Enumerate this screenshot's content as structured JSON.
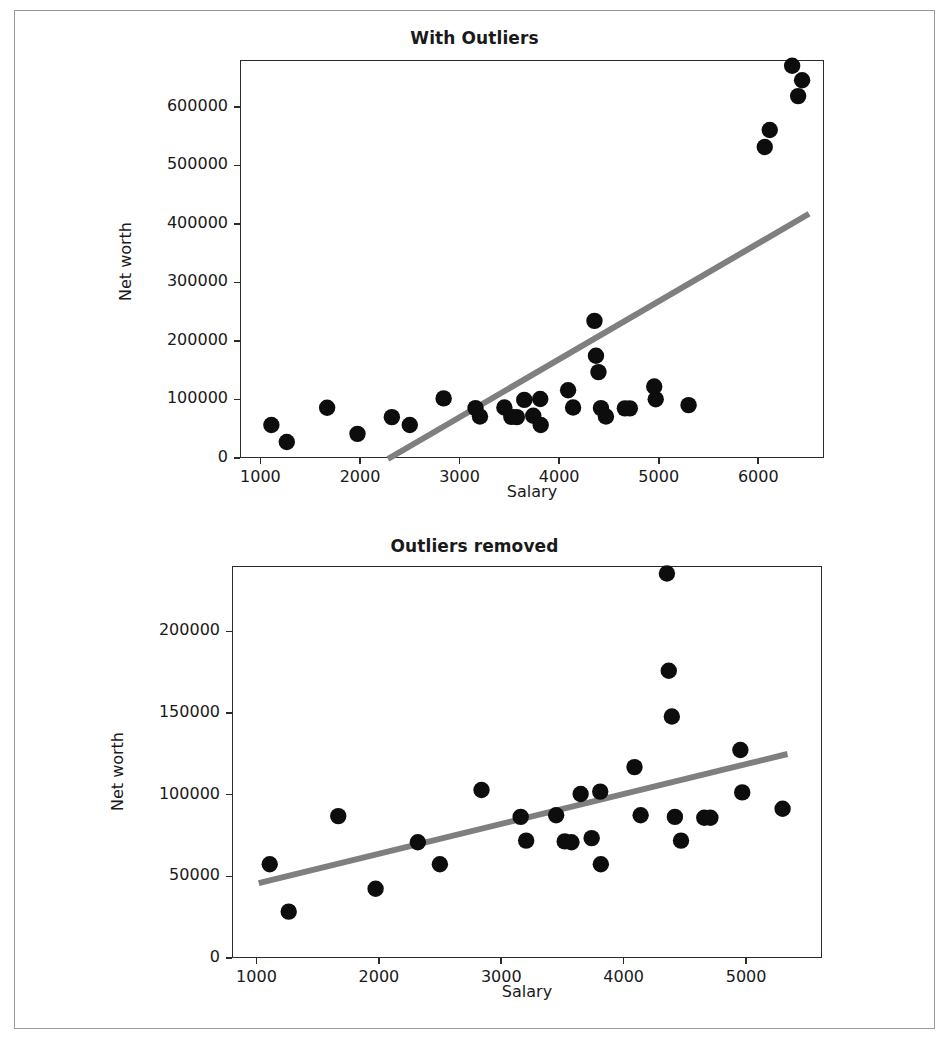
{
  "figure": {
    "background": "#ffffff",
    "border_color": "#9a9a9a",
    "marker_color": "#0d0d0d",
    "line_color": "#7f7f7f"
  },
  "chart_data": [
    {
      "type": "scatter",
      "title": "With Outliers",
      "xlabel": "Salary",
      "ylabel": "Net worth",
      "xlim": [
        795,
        6660
      ],
      "ylim": [
        0,
        680000
      ],
      "xticks": [
        1000,
        2000,
        3000,
        4000,
        5000,
        6000
      ],
      "xticklabels": [
        "1000",
        "2000",
        "3000",
        "4000",
        "5000",
        "6000"
      ],
      "yticks": [
        0,
        100000,
        200000,
        300000,
        400000,
        500000,
        600000
      ],
      "yticklabels": [
        "0",
        "100000",
        "200000",
        "300000",
        "400000",
        "500000",
        "600000"
      ],
      "grid": false,
      "legend": "none",
      "points": [
        {
          "x": 1100,
          "y": 58000
        },
        {
          "x": 1255,
          "y": 29000
        },
        {
          "x": 1660,
          "y": 87500
        },
        {
          "x": 1965,
          "y": 43000
        },
        {
          "x": 2310,
          "y": 71500
        },
        {
          "x": 2490,
          "y": 58000
        },
        {
          "x": 2830,
          "y": 103500
        },
        {
          "x": 3150,
          "y": 87000
        },
        {
          "x": 3195,
          "y": 72500
        },
        {
          "x": 3440,
          "y": 88000
        },
        {
          "x": 3510,
          "y": 72000
        },
        {
          "x": 3565,
          "y": 71500
        },
        {
          "x": 3640,
          "y": 101000
        },
        {
          "x": 3730,
          "y": 74000
        },
        {
          "x": 3805,
          "y": 58000
        },
        {
          "x": 3800,
          "y": 102500
        },
        {
          "x": 4080,
          "y": 117500
        },
        {
          "x": 4130,
          "y": 88000
        },
        {
          "x": 4345,
          "y": 236000
        },
        {
          "x": 4360,
          "y": 176500
        },
        {
          "x": 4385,
          "y": 148500
        },
        {
          "x": 4410,
          "y": 87000
        },
        {
          "x": 4460,
          "y": 72500
        },
        {
          "x": 4650,
          "y": 86500
        },
        {
          "x": 4700,
          "y": 86500
        },
        {
          "x": 4945,
          "y": 124000
        },
        {
          "x": 4960,
          "y": 102000
        },
        {
          "x": 5290,
          "y": 92000
        },
        {
          "x": 6055,
          "y": 533000
        },
        {
          "x": 6105,
          "y": 562000
        },
        {
          "x": 6330,
          "y": 672000
        },
        {
          "x": 6390,
          "y": 620000
        },
        {
          "x": 6430,
          "y": 647000
        }
      ],
      "fit_line": {
        "x_start": 2270,
        "y_start": 0,
        "x_end": 6500,
        "y_end": 419000
      }
    },
    {
      "type": "scatter",
      "title": "Outliers removed",
      "xlabel": "Salary",
      "ylabel": "Net worth",
      "xlim": [
        800,
        5620
      ],
      "ylim": [
        0,
        240000
      ],
      "xticks": [
        1000,
        2000,
        3000,
        4000,
        5000
      ],
      "xticklabels": [
        "1000",
        "2000",
        "3000",
        "4000",
        "5000"
      ],
      "yticks": [
        0,
        50000,
        100000,
        150000,
        200000
      ],
      "yticklabels": [
        "0",
        "50000",
        "100000",
        "150000",
        "200000"
      ],
      "grid": false,
      "legend": "none",
      "points": [
        {
          "x": 1100,
          "y": 58000
        },
        {
          "x": 1255,
          "y": 29000
        },
        {
          "x": 1660,
          "y": 87500
        },
        {
          "x": 1965,
          "y": 43000
        },
        {
          "x": 2310,
          "y": 71500
        },
        {
          "x": 2490,
          "y": 58000
        },
        {
          "x": 2830,
          "y": 103500
        },
        {
          "x": 3150,
          "y": 87000
        },
        {
          "x": 3195,
          "y": 72500
        },
        {
          "x": 3440,
          "y": 88000
        },
        {
          "x": 3510,
          "y": 72000
        },
        {
          "x": 3565,
          "y": 71500
        },
        {
          "x": 3640,
          "y": 101000
        },
        {
          "x": 3730,
          "y": 74000
        },
        {
          "x": 3805,
          "y": 58000
        },
        {
          "x": 3800,
          "y": 102500
        },
        {
          "x": 4080,
          "y": 117500
        },
        {
          "x": 4130,
          "y": 88000
        },
        {
          "x": 4345,
          "y": 236000
        },
        {
          "x": 4360,
          "y": 176500
        },
        {
          "x": 4385,
          "y": 148500
        },
        {
          "x": 4410,
          "y": 87000
        },
        {
          "x": 4460,
          "y": 72500
        },
        {
          "x": 4650,
          "y": 86500
        },
        {
          "x": 4700,
          "y": 86500
        },
        {
          "x": 4945,
          "y": 128000
        },
        {
          "x": 4960,
          "y": 102000
        },
        {
          "x": 5290,
          "y": 92000
        }
      ],
      "fit_line": {
        "x_start": 1010,
        "y_start": 46500,
        "x_end": 5330,
        "y_end": 125500
      }
    }
  ]
}
